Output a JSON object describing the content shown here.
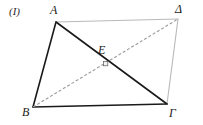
{
  "figure": {
    "panel_label": "(I)",
    "width": 203,
    "height": 125,
    "background_color": "#ffffff",
    "shape_name": "parallelogram",
    "labels": {
      "vertex_a": "A",
      "vertex_delta": "Δ",
      "vertex_beta": "B",
      "vertex_gamma": "Γ",
      "intersection_e": "E"
    },
    "colors": {
      "solid_stroke": "#1a1a1a",
      "light_stroke": "#b9b9b9",
      "dashed_stroke": "#9a9a9a",
      "point_fill": "#f2f2f2",
      "text": "#1a1a1a"
    },
    "points": {
      "A": {
        "x": 56,
        "y": 22
      },
      "D": {
        "x": 178,
        "y": 19
      },
      "B": {
        "x": 33,
        "y": 107
      },
      "G": {
        "x": 167,
        "y": 104
      },
      "E": {
        "x": 106,
        "y": 64
      }
    },
    "edges": [
      {
        "name": "side-AB",
        "from": "A",
        "to": "B",
        "style": "solid",
        "color": "#1a1a1a",
        "width": 1.6
      },
      {
        "name": "side-BG",
        "from": "B",
        "to": "G",
        "style": "solid",
        "color": "#1a1a1a",
        "width": 1.6
      },
      {
        "name": "side-AD",
        "from": "A",
        "to": "D",
        "style": "solid",
        "color": "#b9b9b9",
        "width": 1.1
      },
      {
        "name": "side-DG",
        "from": "D",
        "to": "G",
        "style": "solid",
        "color": "#b9b9b9",
        "width": 1.1
      },
      {
        "name": "diagonal-AG",
        "from": "A",
        "to": "G",
        "style": "solid",
        "color": "#1a1a1a",
        "width": 1.6
      },
      {
        "name": "diagonal-BD",
        "from": "B",
        "to": "D",
        "style": "dashed",
        "color": "#9a9a9a",
        "width": 1.1,
        "dash": "3 2"
      }
    ]
  }
}
